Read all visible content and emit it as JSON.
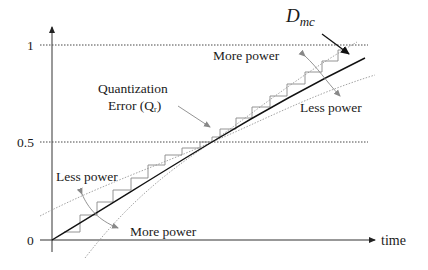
{
  "diagram": {
    "title": "",
    "y_axis": {
      "ticks": [
        {
          "label": "1",
          "y": 45
        },
        {
          "label": "0.5",
          "y": 142
        },
        {
          "label": "0",
          "y": 240
        }
      ]
    },
    "x_axis": {
      "label": "time"
    },
    "curve_label": {
      "main": "D",
      "sub": "mc"
    },
    "annotations": {
      "quantization_line1": "Quantization",
      "quantization_line2": "Error (Q",
      "quantization_sub": "r",
      "quantization_close": ")",
      "more_power_top": "More power",
      "less_power_right": "Less power",
      "less_power_left": "Less power",
      "more_power_bottom": "More power"
    },
    "colors": {
      "axis": "#444444",
      "main_line": "#111111",
      "staircase": "#888888",
      "dotted": "#999999",
      "arrow_gray": "#888888"
    }
  }
}
